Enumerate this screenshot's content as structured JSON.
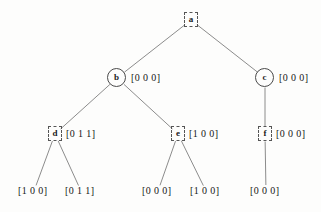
{
  "diagram": {
    "background_color": "#fdfdfc",
    "edge_color": "#6f6f6f",
    "node_stroke_color": "#4a4a4a",
    "text_color": "#171717"
  },
  "nodes": [
    {
      "id": "a",
      "label": "a",
      "shape": "dashed-box",
      "vector": "",
      "x": 191,
      "y": 20
    },
    {
      "id": "b",
      "label": "b",
      "shape": "circle",
      "vector": "[0 0 0]",
      "x": 117,
      "y": 78
    },
    {
      "id": "c",
      "label": "c",
      "shape": "circle",
      "vector": "[0 0 0]",
      "x": 265,
      "y": 78
    },
    {
      "id": "d",
      "label": "d",
      "shape": "dashed-box",
      "vector": "[0 1 1]",
      "x": 55,
      "y": 134
    },
    {
      "id": "e",
      "label": "e",
      "shape": "dashed-box",
      "vector": "[1 0 0]",
      "x": 178,
      "y": 134
    },
    {
      "id": "f",
      "label": "f",
      "shape": "dashed-box",
      "vector": "[0 0 0]",
      "x": 265,
      "y": 134
    }
  ],
  "leaves": [
    {
      "id": "leaf1",
      "vector": "[1 0 0]",
      "parent": "d",
      "x": 34,
      "y": 191
    },
    {
      "id": "leaf2",
      "vector": "[0 1 1]",
      "parent": "d",
      "x": 81,
      "y": 191
    },
    {
      "id": "leaf3",
      "vector": "[0 0 0]",
      "parent": "e",
      "x": 158,
      "y": 191
    },
    {
      "id": "leaf4",
      "vector": "[1 0 0]",
      "parent": "e",
      "x": 206,
      "y": 191
    },
    {
      "id": "leaf5",
      "vector": "[0 0 0]",
      "parent": "f",
      "x": 266,
      "y": 191
    }
  ],
  "edges": [
    {
      "from": "a",
      "to": "b"
    },
    {
      "from": "a",
      "to": "c"
    },
    {
      "from": "b",
      "to": "d"
    },
    {
      "from": "b",
      "to": "e"
    },
    {
      "from": "c",
      "to": "f"
    },
    {
      "from": "d",
      "to": "leaf1"
    },
    {
      "from": "d",
      "to": "leaf2"
    },
    {
      "from": "e",
      "to": "leaf3"
    },
    {
      "from": "e",
      "to": "leaf4"
    },
    {
      "from": "f",
      "to": "leaf5"
    }
  ]
}
